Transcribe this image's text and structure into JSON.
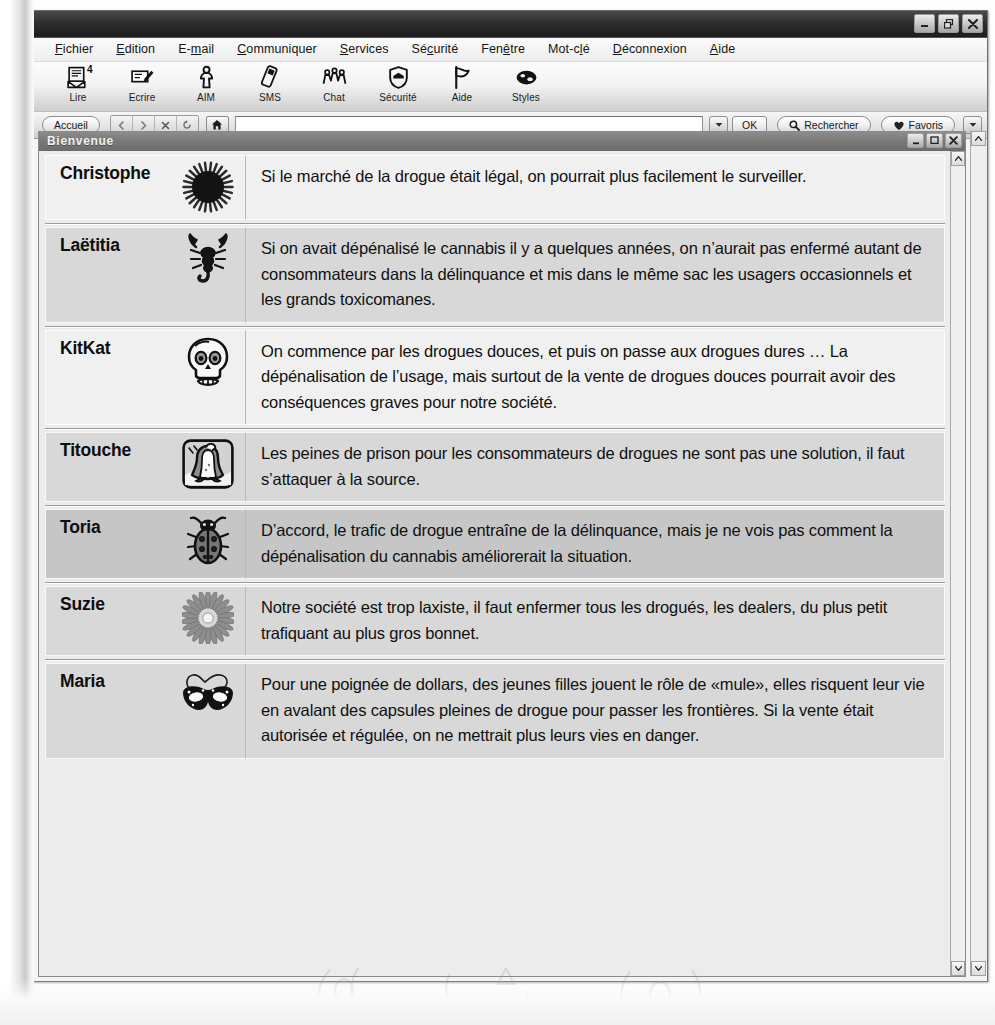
{
  "window": {
    "title": "",
    "controls": [
      {
        "name": "minimize",
        "glyph": "minimize-icon"
      },
      {
        "name": "restore",
        "glyph": "restore-icon"
      },
      {
        "name": "close",
        "glyph": "close-icon"
      }
    ]
  },
  "menubar": {
    "items": [
      {
        "label": "Fichier",
        "accel": "F"
      },
      {
        "label": "Edition",
        "accel": "E"
      },
      {
        "label": "E-mail",
        "accel": "m"
      },
      {
        "label": "Communiquer",
        "accel": "C"
      },
      {
        "label": "Services",
        "accel": "S"
      },
      {
        "label": "Sécurité",
        "accel": "c"
      },
      {
        "label": "Fenêtre",
        "accel": "ê"
      },
      {
        "label": "Mot-clé",
        "accel": "l"
      },
      {
        "label": "Déconnexion",
        "accel": "D"
      },
      {
        "label": "Aide",
        "accel": "A"
      }
    ]
  },
  "toolbar": {
    "buttons": [
      {
        "label": "Lire",
        "icon": "mail-read-icon",
        "badge": "4"
      },
      {
        "label": "Ecrire",
        "icon": "mail-write-icon",
        "badge": ""
      },
      {
        "label": "AIM",
        "icon": "person-icon",
        "badge": ""
      },
      {
        "label": "SMS",
        "icon": "mobile-phone-icon",
        "badge": ""
      },
      {
        "label": "Chat",
        "icon": "people-group-icon",
        "badge": ""
      },
      {
        "label": "Sécurité",
        "icon": "shield-icon",
        "badge": ""
      },
      {
        "label": "Aide",
        "icon": "flag-icon",
        "badge": ""
      },
      {
        "label": "Styles",
        "icon": "palette-icon",
        "badge": ""
      }
    ]
  },
  "navbar": {
    "home_label": "Accueil",
    "address_value": "",
    "address_placeholder": "",
    "ok_label": "OK",
    "search_label": "Rechercher",
    "favorites_label": "Favoris",
    "nav_icons": [
      "back-icon",
      "forward-icon",
      "stop-icon",
      "reload-icon"
    ],
    "home_icon": "home-icon"
  },
  "document": {
    "title": "Bienvenue",
    "controls": [
      {
        "name": "minimize",
        "glyph": "minimize-icon"
      },
      {
        "name": "maximize",
        "glyph": "maximize-icon"
      },
      {
        "name": "close",
        "glyph": "close-icon"
      }
    ],
    "messages": [
      {
        "author": "Christophe",
        "avatar": "dark-sun-icon",
        "tone": "tone-light",
        "text": "Si le marché de la drogue était légal, on pourrait plus facilement le surveiller."
      },
      {
        "author": "Laëtitia",
        "avatar": "scorpion-icon",
        "tone": "tone-mid",
        "text": "Si on avait dépénalisé le cannabis il y a quelques années, on n’aurait pas enfermé autant de consommateurs dans la délinquance et mis dans le même sac les usagers occasionnels et les grands toxicomanes."
      },
      {
        "author": "KitKat",
        "avatar": "skull-icon",
        "tone": "tone-light",
        "text": "On commence par les drogues douces, et puis on passe aux drogues dures … La dépénalisation de l’usage, mais surtout de la vente de drogues douces pourrait avoir des conséquences graves pour notre société."
      },
      {
        "author": "Titouche",
        "avatar": "penguin-icon",
        "tone": "tone-mid",
        "text": "Les peines de prison pour les consommateurs de drogues ne sont pas une solution, il faut s’attaquer à la source."
      },
      {
        "author": "Toria",
        "avatar": "ladybug-icon",
        "tone": "tone-dark",
        "text": "D’accord, le trafic de drogue entraîne de la délinquance, mais je ne vois pas comment la dépénalisation du cannabis améliorerait la situation."
      },
      {
        "author": "Suzie",
        "avatar": "daisy-flower-icon",
        "tone": "tone-mid",
        "text": "Notre société est trop laxiste, il faut enfermer tous les drogués, les dealers, du plus petit trafiquant au plus gros bonnet."
      },
      {
        "author": "Maria",
        "avatar": "carnival-mask-icon",
        "tone": "tone-mid",
        "text": "Pour une poignée de dollars, des jeunes filles jouent le rôle de «mule», elles risquent leur vie en avalant des capsules pleines de drogue pour passer les frontières. Si la vente était autorisée et régulée, on ne mettrait plus leurs vies en danger."
      }
    ]
  }
}
